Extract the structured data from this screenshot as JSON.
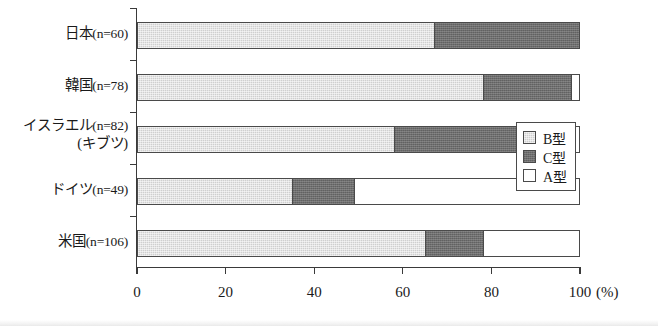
{
  "chart_data": {
    "type": "bar",
    "orientation": "horizontal",
    "stacked": true,
    "title": "",
    "xlabel": "(%)",
    "ylabel": "",
    "xlim": [
      0,
      100
    ],
    "grid": false,
    "legend_position": "right",
    "x_unit": "(%)",
    "categories": [
      "日本(n=60)",
      "韓国(n=78)",
      "イスラエル(n=82)(キブツ)",
      "ドイツ(n=49)",
      "米国(n=106)"
    ],
    "xticks": [
      "0",
      "20",
      "40",
      "60",
      "80",
      "100"
    ],
    "xtick_values": [
      0,
      20,
      40,
      60,
      80,
      100
    ],
    "series": [
      {
        "name": "B型",
        "color": "#cfcfcf",
        "values": [
          67,
          78,
          58,
          35,
          65
        ]
      },
      {
        "name": "C型",
        "color": "#6e6e6e",
        "values": [
          33,
          20,
          36,
          14,
          13
        ]
      },
      {
        "name": "A型",
        "color": "#ffffff",
        "values": [
          0,
          2,
          6,
          51,
          22
        ]
      }
    ]
  },
  "categories_display": [
    {
      "name": "日本",
      "n": "(n=60)",
      "sub": ""
    },
    {
      "name": "韓国",
      "n": "(n=78)",
      "sub": ""
    },
    {
      "name": "イスラエル",
      "n": "(n=82)",
      "sub": "(キブツ)"
    },
    {
      "name": "ドイツ",
      "n": "(n=49)",
      "sub": ""
    },
    {
      "name": "米国",
      "n": "(n=106)",
      "sub": ""
    }
  ],
  "legend": {
    "items": [
      {
        "label": "B型",
        "kind": "b"
      },
      {
        "label": "C型",
        "kind": "c"
      },
      {
        "label": "A型",
        "kind": "a"
      }
    ]
  },
  "axis": {
    "unit_label": "(%)"
  }
}
